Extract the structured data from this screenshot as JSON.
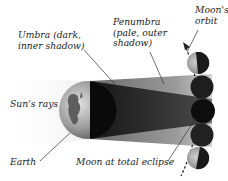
{
  "labels": {
    "umbra": "Umbra (dark,\ninner shadow)",
    "penumbra": "Penumbra\n(pale, outer\nshadow)",
    "moons_orbit": "Moon's\norbit",
    "suns_rays": "Sun's rays",
    "earth": "Earth",
    "moon_total_eclipse": "Moon at total eclipse"
  },
  "colors": {
    "background": "#ffffff",
    "penumbra": "#9a9a9a",
    "umbra": "#3a3a3a",
    "moon_dark": "#1a1a1a",
    "moon_lit": "#a8a8a8",
    "earth_light": "#b8b8b8",
    "earth_dark": "#0a0a0a",
    "leader_line": "#333333"
  },
  "moons": [
    {
      "phase": "partial",
      "cx": 198,
      "cy": 63
    },
    {
      "phase": "penumbral",
      "cx": 202,
      "cy": 87
    },
    {
      "phase": "total",
      "cx": 203,
      "cy": 111
    },
    {
      "phase": "penumbral",
      "cx": 202,
      "cy": 135
    },
    {
      "phase": "partial",
      "cx": 198,
      "cy": 158
    }
  ]
}
